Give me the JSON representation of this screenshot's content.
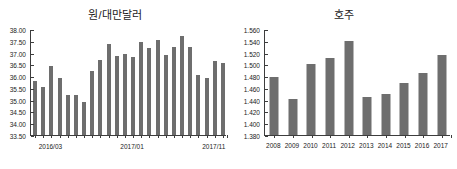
{
  "charts": {
    "left": {
      "title": "원/대만달러",
      "axis_tick_labels_x": [
        "2016/03",
        "2017/01",
        "2017/11"
      ]
    },
    "right": {
      "title": "호주"
    }
  },
  "chart_data": [
    {
      "type": "bar",
      "title": "원/대만달러",
      "xlabel": "",
      "ylabel": "",
      "ylim": [
        33.5,
        38.0
      ],
      "ytick_labels": [
        "38.00",
        "37.50",
        "37.00",
        "36.50",
        "36.00",
        "35.50",
        "35.00",
        "34.50",
        "34.00",
        "33.50"
      ],
      "yticks": [
        38.0,
        37.5,
        37.0,
        36.5,
        36.0,
        35.5,
        35.0,
        34.5,
        34.0,
        33.5
      ],
      "grid": false,
      "legend": "none",
      "categories": [
        "2016/01",
        "2016/02",
        "2016/03",
        "2016/04",
        "2016/05",
        "2016/06",
        "2016/07",
        "2016/08",
        "2016/09",
        "2016/10",
        "2016/11",
        "2016/12",
        "2017/01",
        "2017/02",
        "2017/03",
        "2017/04",
        "2017/05",
        "2017/06",
        "2017/07",
        "2017/08",
        "2017/09",
        "2017/10",
        "2017/11",
        "2017/12"
      ],
      "visible_xtick_labels": [
        {
          "category": "2016/03",
          "label": "2016/03"
        },
        {
          "category": "2017/01",
          "label": "2017/01"
        },
        {
          "category": "2017/11",
          "label": "2017/11"
        }
      ],
      "values": [
        35.8,
        35.52,
        36.45,
        35.9,
        35.22,
        35.22,
        34.9,
        36.2,
        36.7,
        37.38,
        36.85,
        36.92,
        36.82,
        37.45,
        37.2,
        37.52,
        36.9,
        37.23,
        37.7,
        37.22,
        36.05,
        35.9,
        36.63,
        36.55
      ],
      "bar_color": "#6e6e6e"
    },
    {
      "type": "bar",
      "title": "호주",
      "xlabel": "",
      "ylabel": "",
      "ylim": [
        1.38,
        1.56
      ],
      "ytick_labels": [
        "1.560",
        "1.540",
        "1.520",
        "1.500",
        "1.480",
        "1.460",
        "1.440",
        "1.420",
        "1.400",
        "1.380"
      ],
      "yticks": [
        1.56,
        1.54,
        1.52,
        1.5,
        1.48,
        1.46,
        1.44,
        1.42,
        1.4,
        1.38
      ],
      "grid": false,
      "legend": "none",
      "categories": [
        "2008",
        "2009",
        "2010",
        "2011",
        "2012",
        "2013",
        "2014",
        "2015",
        "2016",
        "2017"
      ],
      "values": [
        1.478,
        1.441,
        1.5,
        1.51,
        1.54,
        1.445,
        1.45,
        1.469,
        1.485,
        1.516
      ],
      "bar_color": "#6e6e6e"
    }
  ]
}
